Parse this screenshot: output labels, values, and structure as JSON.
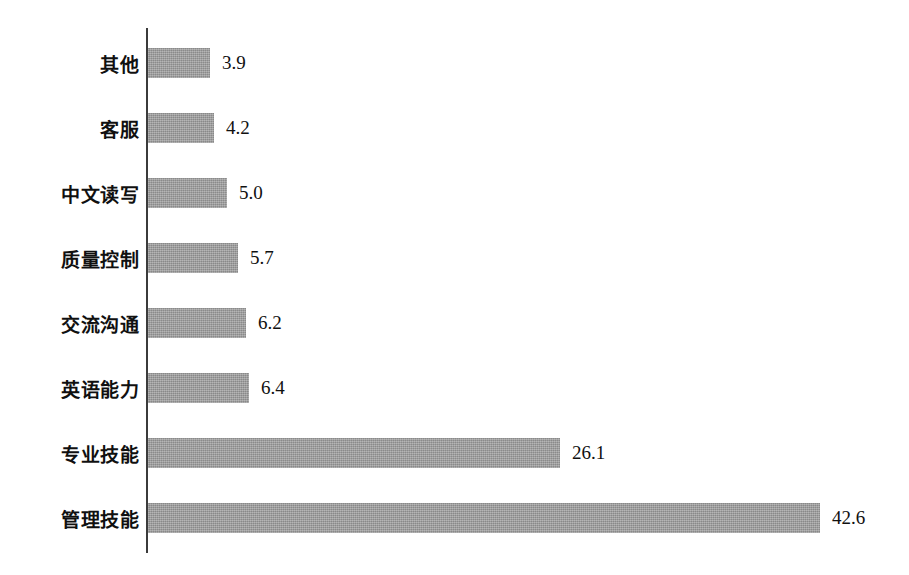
{
  "chart_data": {
    "type": "bar",
    "orientation": "horizontal",
    "title": "",
    "subtitle": "",
    "xlabel": "",
    "ylabel": "",
    "categories": [
      "其他",
      "客服",
      "中文读写",
      "质量控制",
      "交流沟通",
      "英语能力",
      "专业技能",
      "管理技能"
    ],
    "values": [
      3.9,
      4.2,
      5.0,
      5.7,
      6.2,
      6.4,
      26.1,
      42.6
    ],
    "value_labels": [
      "3.9",
      "4.2",
      "5.0",
      "5.7",
      "6.2",
      "6.4",
      "26.1",
      "42.6"
    ],
    "series": [
      {
        "name": "",
        "values": [
          3.9,
          4.2,
          5.0,
          5.7,
          6.2,
          6.4,
          26.1,
          42.6
        ]
      }
    ],
    "xlim": [
      0,
      42.6
    ],
    "grid": false,
    "legend": false,
    "legend_position": "none",
    "bar_color": "#9a9a9a",
    "axis_color": "#3b3b3b",
    "background_color": "#ffffff",
    "data_labels_shown": true
  },
  "chart": {
    "bars": [
      {
        "label": "其他",
        "value_label": "3.9",
        "value": 3.9
      },
      {
        "label": "客服",
        "value_label": "4.2",
        "value": 4.2
      },
      {
        "label": "中文读写",
        "value_label": "5.0",
        "value": 5.0
      },
      {
        "label": "质量控制",
        "value_label": "5.7",
        "value": 5.7
      },
      {
        "label": "交流沟通",
        "value_label": "6.2",
        "value": 6.2
      },
      {
        "label": "英语能力",
        "value_label": "6.4",
        "value": 6.4
      },
      {
        "label": "专业技能",
        "value_label": "26.1",
        "value": 26.1
      },
      {
        "label": "管理技能",
        "value_label": "42.6",
        "value": 42.6
      }
    ]
  }
}
